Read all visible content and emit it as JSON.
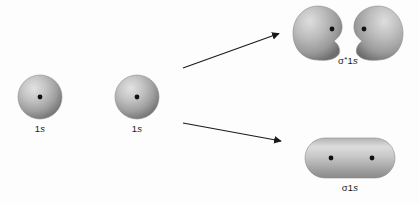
{
  "diagram": {
    "background_color": "#fdfdfd",
    "ink_color": "#1a1a1a",
    "orbital_fill_light": "#d8d8d8",
    "orbital_fill_mid": "#a8a8a8",
    "orbital_fill_dark": "#707070",
    "nucleus_color": "#111111",
    "atomic_orbitals": [
      {
        "id": "left-1s",
        "label": "1s",
        "label_prefix": "1",
        "label_italic": "s",
        "shape": "sphere",
        "cx": 40,
        "cy": 97,
        "r": 22
      },
      {
        "id": "right-1s",
        "label": "1s",
        "label_prefix": "1",
        "label_italic": "s",
        "shape": "sphere",
        "cx": 137,
        "cy": 97,
        "r": 22
      }
    ],
    "arrows": [
      {
        "id": "arrow-to-antibonding",
        "direction": "up-right",
        "x1": 183,
        "y1": 68,
        "x2": 283,
        "y2": 32
      },
      {
        "id": "arrow-to-bonding",
        "direction": "down-right",
        "x1": 183,
        "y1": 123,
        "x2": 285,
        "y2": 142
      }
    ],
    "molecular_orbitals": [
      {
        "id": "antibonding",
        "label_sigma": "σ",
        "label_star": "*",
        "label_suffix_prefix": "1",
        "label_suffix_italic": "s",
        "label_full": "σ*1s",
        "type": "antibonding",
        "shape": "two-teardrop-lobes",
        "label_x": 348,
        "label_y": 62
      },
      {
        "id": "bonding",
        "label_sigma": "σ",
        "label_star": "",
        "label_suffix_prefix": "1",
        "label_suffix_italic": "s",
        "label_full": "σ1s",
        "type": "bonding",
        "shape": "merged-capsule",
        "label_x": 350,
        "label_y": 188
      }
    ]
  }
}
